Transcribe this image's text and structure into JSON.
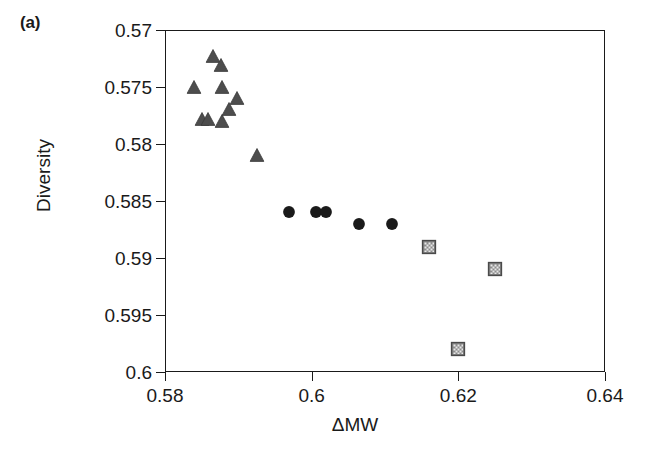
{
  "figure": {
    "panel_label": "(a)",
    "background_color": "#ffffff",
    "axis_color": "#1a1a1a"
  },
  "chart_data": {
    "type": "scatter",
    "title": "",
    "subtitle": "",
    "xlabel": "ΔMW",
    "ylabel": "Diversity",
    "xlim": [
      0.58,
      0.64
    ],
    "ylim": [
      0.6,
      0.57
    ],
    "y_axis_inverted": true,
    "grid": false,
    "legend": "none",
    "xticks": [
      0.58,
      0.6,
      0.62,
      0.64
    ],
    "xtick_labels": [
      "0.58",
      "0.6",
      "0.62",
      "0.64"
    ],
    "yticks": [
      0.57,
      0.575,
      0.58,
      0.585,
      0.59,
      0.595,
      0.6
    ],
    "ytick_labels": [
      "0.57",
      "0.575",
      "0.58",
      "0.585",
      "0.59",
      "0.595",
      "0.6"
    ],
    "marker_colors": {
      "triangle": "#4d4d4d",
      "circle": "#1a1a1a",
      "square": "#8c8c8c"
    },
    "series": [
      {
        "name": "triangles",
        "marker": "triangle",
        "color": "#4d4d4d",
        "points": [
          {
            "x": 0.5865,
            "y": 0.5723
          },
          {
            "x": 0.5876,
            "y": 0.5731
          },
          {
            "x": 0.584,
            "y": 0.575
          },
          {
            "x": 0.5878,
            "y": 0.575
          },
          {
            "x": 0.5898,
            "y": 0.576
          },
          {
            "x": 0.5887,
            "y": 0.5769
          },
          {
            "x": 0.5851,
            "y": 0.5778
          },
          {
            "x": 0.5858,
            "y": 0.5778
          },
          {
            "x": 0.5878,
            "y": 0.578
          },
          {
            "x": 0.5926,
            "y": 0.581
          }
        ]
      },
      {
        "name": "circles",
        "marker": "circle",
        "color": "#1a1a1a",
        "points": [
          {
            "x": 0.5969,
            "y": 0.586
          },
          {
            "x": 0.6006,
            "y": 0.586
          },
          {
            "x": 0.6019,
            "y": 0.586
          },
          {
            "x": 0.6064,
            "y": 0.587
          },
          {
            "x": 0.611,
            "y": 0.587
          }
        ]
      },
      {
        "name": "squares",
        "marker": "square",
        "color": "#8c8c8c",
        "points": [
          {
            "x": 0.616,
            "y": 0.589
          },
          {
            "x": 0.62,
            "y": 0.598
          },
          {
            "x": 0.625,
            "y": 0.591
          }
        ]
      }
    ]
  }
}
